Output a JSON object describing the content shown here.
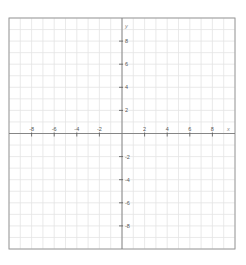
{
  "chart_data": {
    "type": "scatter",
    "title": "",
    "xlabel": "x",
    "ylabel": "y",
    "xlim": [
      -10,
      10
    ],
    "ylim": [
      -10,
      10
    ],
    "grid": true,
    "grid_step": 1,
    "x_ticks": [
      -8,
      -6,
      -4,
      -2,
      2,
      4,
      6,
      8
    ],
    "y_ticks": [
      8,
      6,
      4,
      2,
      -2,
      -4,
      -6,
      -8
    ],
    "x_tick_labels": [
      "-8",
      "-6",
      "-4",
      "-2",
      "2",
      "4",
      "6",
      "8"
    ],
    "y_tick_labels": [
      "8",
      "6",
      "4",
      "2",
      "-2",
      "-4",
      "-6",
      "-8"
    ],
    "series": [],
    "legend": null
  },
  "plot": {
    "left": 9,
    "top": 18,
    "width": 226,
    "height": 231,
    "colors": {
      "background": "#ffffff",
      "grid": "#e4e4e4",
      "border": "#9a9a9a",
      "axis": "#7a7a7a",
      "tick": "#555555",
      "label": "#555555"
    }
  },
  "axes": {
    "x_name": "x",
    "y_name": "y"
  }
}
